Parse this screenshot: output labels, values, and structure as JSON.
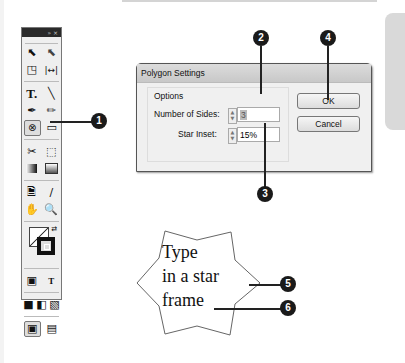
{
  "toolbar": {
    "header_controls": "» ×",
    "tools": [
      [
        "selection-tool",
        "direct-selection-tool"
      ],
      [
        "page-tool",
        "gap-tool"
      ],
      [
        "type-tool",
        "line-tool"
      ],
      [
        "pen-tool",
        "pencil-tool"
      ],
      [
        "polygon-frame-tool",
        "rectangle-tool"
      ],
      [
        "scissors-tool",
        "free-transform-tool"
      ],
      [
        "gradient-swatch-tool",
        "gradient-feather-tool"
      ],
      [
        "note-tool",
        "eyedropper-tool"
      ],
      [
        "hand-tool",
        "zoom-tool"
      ]
    ],
    "formatting_label": "T"
  },
  "dialog": {
    "title": "Polygon Settings",
    "group_label": "Options",
    "sides_label": "Number of Sides:",
    "sides_value": "3",
    "inset_label": "Star Inset:",
    "inset_value": "15%",
    "ok_label": "OK",
    "cancel_label": "Cancel"
  },
  "star_frame": {
    "lines": [
      "Type",
      "in a star",
      "frame"
    ]
  },
  "callouts": [
    "1",
    "2",
    "3",
    "4",
    "5",
    "6"
  ]
}
